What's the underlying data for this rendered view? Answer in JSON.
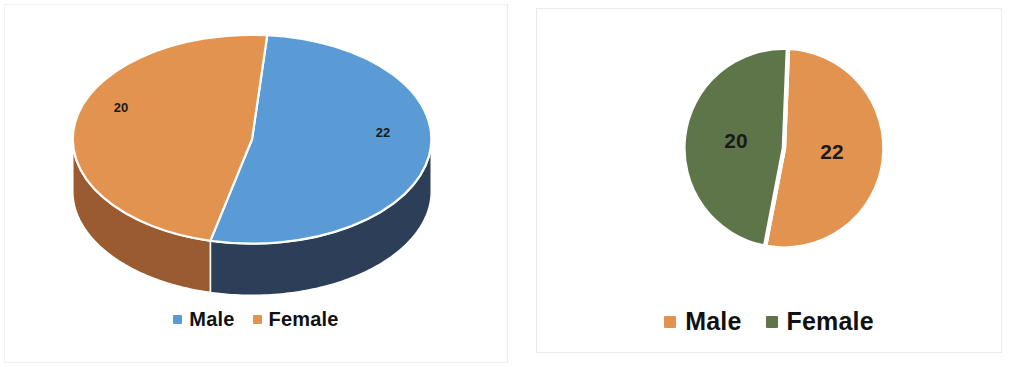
{
  "page": {
    "background_color": "#ffffff",
    "width": 1016,
    "height": 367
  },
  "palette": {
    "blue": "#5A9BD5",
    "blue_side": "#2C3E58",
    "orange": "#E2934F",
    "orange_side": "#9A5B31",
    "green": "#5E7549",
    "label_color": "#1A1A1A",
    "separator": "#FFFFFF",
    "panel_border": "#ECECEC"
  },
  "charts": [
    {
      "id": "chart-3d-pie",
      "type": "pie-3d",
      "legend": {
        "position": "bottom",
        "items": [
          {
            "label": "Male",
            "color": "#5A9BD5"
          },
          {
            "label": "Female",
            "color": "#E2934F"
          }
        ]
      },
      "slices": [
        {
          "label": "Male",
          "value": 22,
          "color": "#5A9BD5",
          "side_color": "#2C3E58",
          "data_label": "22"
        },
        {
          "label": "Female",
          "value": 20,
          "color": "#E2934F",
          "side_color": "#9A5B31",
          "data_label": "20"
        }
      ]
    },
    {
      "id": "chart-flat-pie",
      "type": "pie",
      "legend": {
        "position": "bottom",
        "items": [
          {
            "label": "Male",
            "color": "#E2934F"
          },
          {
            "label": "Female",
            "color": "#5E7549"
          }
        ]
      },
      "slices": [
        {
          "label": "Male",
          "value": 22,
          "color": "#E2934F",
          "data_label": "22"
        },
        {
          "label": "Female",
          "value": 20,
          "color": "#5E7549",
          "data_label": "20"
        }
      ]
    }
  ],
  "chart_data": [
    {
      "type": "pie",
      "title": "",
      "subtitle": "",
      "render_style": "3d-elliptical-pie",
      "categories": [
        "Male",
        "Female"
      ],
      "values": [
        22,
        20
      ],
      "data_labels": [
        "22",
        "20"
      ],
      "percentages": [
        52.4,
        47.6
      ],
      "total": 42,
      "colors": [
        "#5A9BD5",
        "#E2934F"
      ],
      "legend": [
        "Male",
        "Female"
      ],
      "legend_position": "bottom",
      "xlabel": "",
      "ylabel": "",
      "grid": false
    },
    {
      "type": "pie",
      "title": "",
      "subtitle": "",
      "render_style": "flat-circular-pie",
      "categories": [
        "Male",
        "Female"
      ],
      "values": [
        22,
        20
      ],
      "data_labels": [
        "22",
        "20"
      ],
      "percentages": [
        52.4,
        47.6
      ],
      "total": 42,
      "colors": [
        "#E2934F",
        "#5E7549"
      ],
      "legend": [
        "Male",
        "Female"
      ],
      "legend_position": "bottom",
      "xlabel": "",
      "ylabel": "",
      "grid": false
    }
  ]
}
